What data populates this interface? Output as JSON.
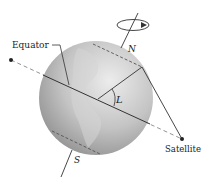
{
  "diagram": {
    "labels": {
      "equator": "Equator",
      "north": "N",
      "south": "S",
      "angle": "L",
      "satellite": "Satellite"
    },
    "colors": {
      "globe_light": "#e4e4e4",
      "globe_dark": "#9a9a9a",
      "lines": "#333333",
      "dashed": "#666666"
    }
  }
}
